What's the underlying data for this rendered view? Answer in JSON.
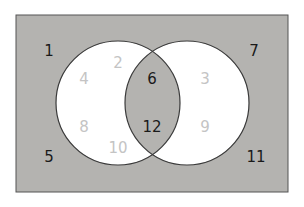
{
  "diagram": {
    "type": "venn",
    "colors": {
      "background": "#b4b3b0",
      "circle_fill": "#ffffff",
      "intersection_fill": "#b4b3b0",
      "outline": "#3a3a3a",
      "dark_text": "#1a1a1a",
      "light_text": "#c4c4c4"
    },
    "outside": [
      "1",
      "5",
      "7",
      "11"
    ],
    "left_only": [
      "2",
      "4",
      "8",
      "10"
    ],
    "intersection": [
      "6",
      "12"
    ],
    "right_only": [
      "3",
      "9"
    ],
    "labels": {
      "n1": "1",
      "n2": "2",
      "n3": "3",
      "n4": "4",
      "n5": "5",
      "n6": "6",
      "n7": "7",
      "n8": "8",
      "n9": "9",
      "n10": "10",
      "n11": "11",
      "n12": "12"
    }
  }
}
